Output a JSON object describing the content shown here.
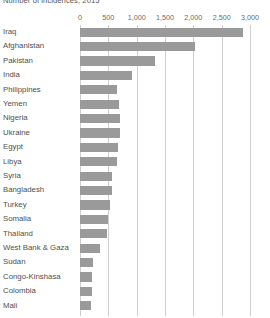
{
  "chart_data": {
    "type": "bar",
    "orientation": "horizontal",
    "title": "",
    "subtitle": "Number of incidences, 2015",
    "xlabel": "",
    "ylabel": "",
    "xlim": [
      0,
      3000
    ],
    "xticks": [
      0,
      500,
      1000,
      1500,
      2000,
      2500,
      3000
    ],
    "xtick_labels": [
      "0",
      "500",
      "1,000",
      "1,500",
      "2,000",
      "2,500",
      "3,000"
    ],
    "grid": true,
    "grid_axis": "x",
    "legend": false,
    "categories": [
      "Iraq",
      "Afghanistan",
      "Pakistan",
      "India",
      "Philippines",
      "Yemen",
      "Nigeria",
      "Ukraine",
      "Egypt",
      "Libya",
      "Syria",
      "Bangladesh",
      "Turkey",
      "Somalia",
      "Thailand",
      "West Bank & Gaza",
      "Sudan",
      "Congo-Kinshasa",
      "Colombia",
      "Mali"
    ],
    "values": [
      2875,
      2030,
      1320,
      920,
      650,
      690,
      700,
      700,
      670,
      650,
      570,
      570,
      530,
      495,
      475,
      355,
      230,
      210,
      205,
      195
    ],
    "bar_color": "#9a9a9a",
    "grid_color": "#cfcfcf",
    "text_color": "#4f4f4f"
  }
}
